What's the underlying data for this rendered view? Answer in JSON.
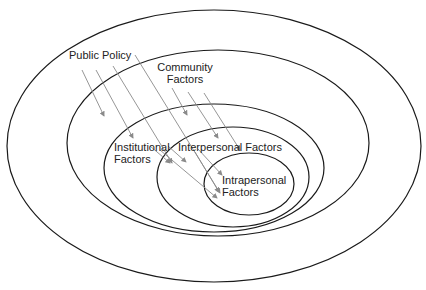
{
  "diagram": {
    "type": "nested-ellipses",
    "layers": [
      {
        "label": "Public Policy",
        "level": 1
      },
      {
        "label": "Community Factors",
        "level": 2
      },
      {
        "label": "Institutional Factors",
        "level": 3
      },
      {
        "label": "Interpersonal Factors",
        "level": 4
      },
      {
        "label": "Intrapersonal Factors",
        "level": 5
      }
    ],
    "labels": {
      "public_policy": "Public Policy",
      "community_line1": "Community",
      "community_line2": "Factors",
      "institutional_line1": "Institutional",
      "institutional_line2": "Factors",
      "interpersonal": "Interpersonal Factors",
      "intrapersonal_line1": "Intrapersonal",
      "intrapersonal_line2": "Factors"
    },
    "colors": {
      "ellipse_stroke": "#1a1a1a",
      "arrow_stroke": "#8a8a8a",
      "text": "#222222",
      "background": "#ffffff"
    }
  }
}
